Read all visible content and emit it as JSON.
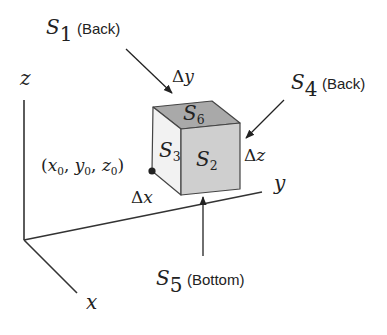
{
  "diagram": {
    "type": "3d-box-flux-surfaces",
    "axes": {
      "x_label": "x",
      "y_label": "y",
      "z_label": "z"
    },
    "cube": {
      "faces": {
        "top": "S",
        "top_sub": "6",
        "left": "S",
        "left_sub": "3",
        "front": "S",
        "front_sub": "2"
      },
      "colors": {
        "top": "#a9a9a9",
        "front": "#cfcfcf",
        "left": "#f2f2f2",
        "edge": "#444444"
      }
    },
    "point": {
      "open": "(",
      "x": "x",
      "x_sub": "0",
      "sep1": ", ",
      "y": "y",
      "y_sub": "0",
      "sep2": ", ",
      "z": "z",
      "z_sub": "0",
      "close": ")"
    },
    "deltas": {
      "dx_delta": "Δ",
      "dx_var": "x",
      "dy_delta": "Δ",
      "dy_var": "y",
      "dz_delta": "Δ",
      "dz_var": "z"
    },
    "callouts": [
      {
        "symbol": "S",
        "sub": "1",
        "note": "(Back)"
      },
      {
        "symbol": "S",
        "sub": "4",
        "note": "(Back)"
      },
      {
        "symbol": "S",
        "sub": "5",
        "note": "(Bottom)"
      }
    ]
  }
}
